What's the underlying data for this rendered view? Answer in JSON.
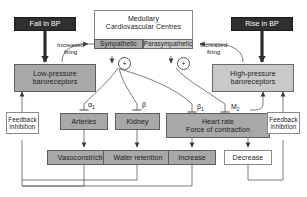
{
  "diagram": {
    "colors": {
      "dark_box": "#2e2e2e",
      "mid_grey": "#a8a8a8",
      "light_grey": "#c9c9c9",
      "white_box": "#ffffff",
      "line": "#5a5a5a",
      "text_dark": "#1a1a1a",
      "text_light": "#ffffff"
    },
    "nodes": {
      "fall_in_bp": "Fall in BP",
      "rise_in_bp": "Rise in BP",
      "medullary_line1": "Medullary",
      "medullary_line2": "Cardiovascular Centres",
      "sympathetic": "Sympathetic",
      "parasympathetic": "Parasympathetic",
      "low_pressure_line1": "Low-pressure",
      "low_pressure_line2": "baroreceptors",
      "high_pressure_line1": "High-pressure",
      "high_pressure_line2": "baroreceptors",
      "arteries": "Arteries",
      "kidney": "Kidney",
      "heart_line1": "Heart rate",
      "heart_line2": "Force of contraction",
      "vasoconstriction": "Vasoconstriction",
      "water_retention": "Water retention",
      "increase": "Increase",
      "decrease": "Decrease",
      "feedback_left_line1": "Feedback",
      "feedback_left_line2": "inhibition",
      "feedback_right_line1": "Feedback",
      "feedback_right_line2": "inhibition"
    },
    "labels": {
      "increased_firing_left_line1": "Increased",
      "increased_firing_left_line2": "firing",
      "increased_firing_right_line1": "Increased",
      "increased_firing_right_line2": "firing",
      "plus_left": "+",
      "plus_right": "+"
    },
    "receptors": {
      "alpha1_base": "α",
      "alpha1_sub": "1",
      "beta": "β",
      "beta1_base": "β",
      "beta1_sub": "1",
      "m2_base": "M",
      "m2_sub": "2"
    }
  }
}
